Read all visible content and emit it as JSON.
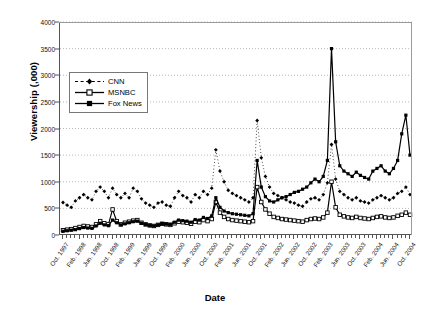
{
  "chart_data": {
    "type": "line",
    "title": "",
    "xlabel": "Date",
    "ylabel": "Viewership (,000)",
    "ylim": [
      0,
      4000
    ],
    "ytick_step": 500,
    "yticks": [
      0,
      500,
      1000,
      1500,
      2000,
      2500,
      3000,
      3500,
      4000
    ],
    "grid": "horizontal-dotted",
    "legend_position": "upper-left-inside",
    "x_start": "Oct. 1997",
    "x_end": "Oct. 2004",
    "x_tick_interval_months": 4,
    "x": [
      "Oct. 1997",
      "Nov. 1997",
      "Dec. 1997",
      "Jan. 1998",
      "Feb. 1998",
      "Mar. 1998",
      "Apr. 1998",
      "May 1998",
      "Jun. 1998",
      "Jul. 1998",
      "Aug. 1998",
      "Sep. 1998",
      "Oct. 1998",
      "Nov. 1998",
      "Dec. 1998",
      "Jan. 1999",
      "Feb. 1999",
      "Mar. 1999",
      "Apr. 1999",
      "May 1999",
      "Jun. 1999",
      "Jul. 1999",
      "Aug. 1999",
      "Sep. 1999",
      "Oct. 1999",
      "Nov. 1999",
      "Dec. 1999",
      "Jan. 2000",
      "Feb. 2000",
      "Mar. 2000",
      "Apr. 2000",
      "May 2000",
      "Jun. 2000",
      "Jul. 2000",
      "Aug. 2000",
      "Sep. 2000",
      "Oct. 2000",
      "Nov. 2000",
      "Dec. 2000",
      "Jan. 2001",
      "Feb. 2001",
      "Mar. 2001",
      "Apr. 2001",
      "May 2001",
      "Jun. 2001",
      "Jul. 2001",
      "Aug. 2001",
      "Sep. 2001",
      "Oct. 2001",
      "Nov. 2001",
      "Dec. 2001",
      "Jan. 2002",
      "Feb. 2002",
      "Mar. 2002",
      "Apr. 2002",
      "May 2002",
      "Jun. 2002",
      "Jul. 2002",
      "Aug. 2002",
      "Sep. 2002",
      "Oct. 2002",
      "Nov. 2002",
      "Dec. 2002",
      "Jan. 2003",
      "Feb. 2003",
      "Mar. 2003",
      "Apr. 2003",
      "May 2003",
      "Jun. 2003",
      "Jul. 2003",
      "Aug. 2003",
      "Sep. 2003",
      "Oct. 2003",
      "Nov. 2003",
      "Dec. 2003",
      "Jan. 2004",
      "Feb. 2004",
      "Mar. 2004",
      "Apr. 2004",
      "May 2004",
      "Jun. 2004",
      "Jul. 2004",
      "Aug. 2004",
      "Sep. 2004",
      "Oct. 2004"
    ],
    "xtick_labels": [
      "Oct. 1997",
      "Feb. 1998",
      "Jun. 1998",
      "Oct. 1998",
      "Feb. 1999",
      "Jun. 1999",
      "Oct. 1999",
      "Feb. 2000",
      "Jun. 2000",
      "Oct. 2000",
      "Feb. 2001",
      "Jun. 2001",
      "Oct. 2001",
      "Feb. 2002",
      "Jun. 2002",
      "Oct. 2002",
      "Feb. 2003",
      "Jun. 2003",
      "Oct. 2003",
      "Feb. 2004",
      "Jun. 2004",
      "Oct. 2004"
    ],
    "series": [
      {
        "name": "CNN",
        "marker": "diamond",
        "line_style": "dotted",
        "color": "#000000",
        "values": [
          610,
          560,
          520,
          640,
          700,
          760,
          700,
          660,
          820,
          900,
          820,
          700,
          880,
          760,
          700,
          780,
          700,
          880,
          820,
          680,
          600,
          560,
          520,
          600,
          620,
          560,
          540,
          700,
          820,
          740,
          700,
          620,
          760,
          700,
          820,
          760,
          880,
          1600,
          1200,
          1000,
          840,
          780,
          740,
          700,
          660,
          620,
          700,
          2150,
          1450,
          1100,
          900,
          780,
          740,
          700,
          660,
          620,
          600,
          560,
          540,
          620,
          680,
          700,
          660,
          760,
          980,
          1700,
          1050,
          820,
          760,
          700,
          660,
          700,
          640,
          620,
          600,
          660,
          700,
          740,
          700,
          660,
          700,
          780,
          820,
          900,
          760
        ]
      },
      {
        "name": "MSNBC",
        "marker": "open-square",
        "line_style": "solid",
        "color": "#000000",
        "values": [
          90,
          100,
          110,
          130,
          150,
          170,
          160,
          150,
          200,
          260,
          220,
          200,
          480,
          260,
          200,
          230,
          250,
          270,
          280,
          230,
          200,
          180,
          170,
          190,
          210,
          200,
          190,
          220,
          250,
          240,
          230,
          210,
          250,
          240,
          280,
          260,
          300,
          620,
          420,
          340,
          300,
          280,
          270,
          260,
          250,
          240,
          260,
          900,
          620,
          480,
          400,
          340,
          320,
          300,
          290,
          280,
          270,
          260,
          250,
          280,
          300,
          310,
          300,
          330,
          420,
          1000,
          520,
          380,
          350,
          330,
          320,
          340,
          320,
          310,
          300,
          320,
          340,
          350,
          330,
          320,
          330,
          360,
          380,
          420,
          380
        ]
      },
      {
        "name": "Fox News",
        "marker": "filled",
        "line_style": "solid",
        "color": "#000000",
        "values": [
          70,
          80,
          90,
          100,
          120,
          140,
          130,
          125,
          170,
          220,
          190,
          175,
          280,
          230,
          190,
          210,
          230,
          250,
          260,
          220,
          195,
          180,
          170,
          190,
          215,
          205,
          200,
          240,
          280,
          270,
          260,
          240,
          290,
          280,
          330,
          310,
          360,
          700,
          520,
          450,
          420,
          400,
          390,
          380,
          370,
          360,
          400,
          1400,
          900,
          720,
          640,
          620,
          660,
          700,
          720,
          760,
          800,
          820,
          860,
          900,
          980,
          1050,
          1000,
          1100,
          1400,
          3500,
          1750,
          1300,
          1200,
          1150,
          1100,
          1180,
          1120,
          1080,
          1050,
          1200,
          1250,
          1300,
          1200,
          1150,
          1250,
          1400,
          1900,
          2250,
          1500
        ]
      }
    ]
  },
  "axis": {
    "y_title": "Viewership (,000)",
    "x_title": "Date"
  },
  "legend": {
    "items": [
      {
        "label": "CNN",
        "key": "dotted-diamond-key"
      },
      {
        "label": "MSNBC",
        "key": "solid-open-square-key"
      },
      {
        "label": "Fox News",
        "key": "solid-filled-key"
      }
    ]
  }
}
